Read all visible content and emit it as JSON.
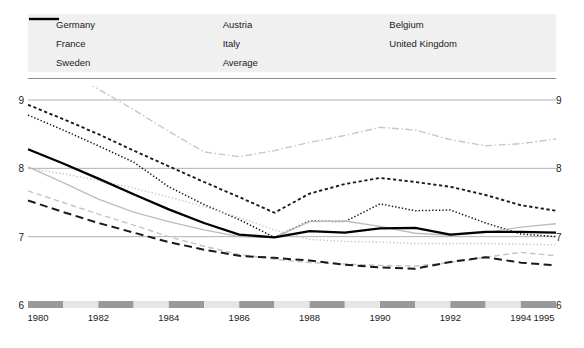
{
  "legend": {
    "items": [
      {
        "label": "Germany",
        "style": "dashed-bold-black",
        "color": "#1a1a1a",
        "col": 0,
        "row": 0
      },
      {
        "label": "France",
        "style": "long-dash-black",
        "color": "#1a1a1a",
        "col": 0,
        "row": 1
      },
      {
        "label": "Sweden",
        "style": "dash-dot-light",
        "color": "#c8c8c8",
        "col": 0,
        "row": 2
      },
      {
        "label": "Austria",
        "style": "dotted-black",
        "color": "#1a1a1a",
        "col": 1,
        "row": 0
      },
      {
        "label": "Italy",
        "style": "dashed-light",
        "color": "#c4c4c4",
        "col": 1,
        "row": 1
      },
      {
        "label": "Average",
        "style": "solid-bold-black",
        "color": "#000000",
        "col": 1,
        "row": 2
      },
      {
        "label": "Belgium",
        "style": "dotted-light",
        "color": "#c4c4c4",
        "col": 2,
        "row": 0
      },
      {
        "label": "United Kingdom",
        "style": "solid-light",
        "color": "#bdbdbd",
        "col": 2,
        "row": 1
      }
    ]
  },
  "chart_data": {
    "type": "line",
    "title": "",
    "xlabel": "",
    "ylabel": "",
    "xlim": [
      1980,
      1995
    ],
    "ylim": [
      6,
      9
    ],
    "grid": true,
    "legend_position": "top",
    "y_ticks": [
      "9",
      "8",
      "7",
      "6"
    ],
    "y_tick_values": [
      9,
      8,
      7,
      6
    ],
    "x_ticks": [
      "1980",
      "1982",
      "1984",
      "1986",
      "1988",
      "1990",
      "1992",
      "1994",
      "1995"
    ],
    "x_tick_values": [
      1980,
      1982,
      1984,
      1986,
      1988,
      1990,
      1992,
      1994,
      1995
    ],
    "x": [
      1980,
      1981,
      1982,
      1983,
      1984,
      1985,
      1986,
      1987,
      1988,
      1989,
      1990,
      1991,
      1992,
      1993,
      1994,
      1995
    ],
    "series": [
      {
        "name": "Germany",
        "color": "#1a1a1a",
        "style": "dashed-bold-black",
        "width": 1.9,
        "values": [
          8.93,
          8.72,
          8.5,
          8.26,
          8.03,
          7.8,
          7.58,
          7.35,
          7.63,
          7.77,
          7.86,
          7.8,
          7.73,
          7.61,
          7.46,
          7.38
        ]
      },
      {
        "name": "Austria",
        "color": "#1a1a1a",
        "style": "dotted-black",
        "width": 1.5,
        "values": [
          8.78,
          8.56,
          8.33,
          8.09,
          7.73,
          7.47,
          7.25,
          6.99,
          7.23,
          7.22,
          7.48,
          7.38,
          7.39,
          7.2,
          7.04,
          7.0
        ]
      },
      {
        "name": "Sweden",
        "color": "#c8c8c8",
        "style": "dash-dot-light",
        "width": 1.4,
        "values": [
          9.72,
          9.44,
          9.16,
          8.86,
          8.54,
          8.24,
          8.17,
          8.26,
          8.38,
          8.48,
          8.6,
          8.56,
          8.42,
          8.33,
          8.36,
          8.43
        ]
      },
      {
        "name": "Italy",
        "color": "#c4c4c4",
        "style": "dashed-light",
        "width": 1.4,
        "values": [
          7.67,
          7.5,
          7.33,
          7.17,
          7.0,
          6.86,
          6.74,
          6.67,
          6.62,
          6.6,
          6.58,
          6.57,
          6.62,
          6.7,
          6.77,
          6.72
        ]
      },
      {
        "name": "Belgium",
        "color": "#c4c4c4",
        "style": "dotted-light",
        "width": 1.4,
        "values": [
          8.0,
          7.92,
          7.82,
          7.71,
          7.58,
          7.44,
          7.28,
          7.1,
          6.96,
          6.93,
          6.92,
          6.9,
          6.9,
          6.9,
          6.89,
          6.88
        ]
      },
      {
        "name": "United Kingdom",
        "color": "#bdbdbd",
        "style": "solid-light",
        "width": 1.4,
        "values": [
          8.02,
          7.79,
          7.55,
          7.36,
          7.22,
          7.1,
          7.0,
          6.99,
          7.22,
          7.23,
          7.15,
          7.05,
          7.02,
          7.06,
          7.14,
          7.19
        ]
      },
      {
        "name": "France",
        "color": "#1a1a1a",
        "style": "long-dash-black",
        "width": 2.0,
        "values": [
          7.53,
          7.36,
          7.2,
          7.06,
          6.92,
          6.81,
          6.72,
          6.69,
          6.65,
          6.59,
          6.55,
          6.53,
          6.63,
          6.7,
          6.62,
          6.58
        ]
      },
      {
        "name": "Average",
        "color": "#000000",
        "style": "solid-bold-black",
        "width": 2.3,
        "values": [
          8.28,
          8.07,
          7.85,
          7.62,
          7.4,
          7.2,
          7.03,
          6.99,
          7.08,
          7.06,
          7.12,
          7.13,
          7.03,
          7.07,
          7.07,
          7.06
        ]
      }
    ]
  },
  "axis_bar": {
    "segments": 15,
    "dark_color": "#999999",
    "light_color": "#e6e6e6"
  }
}
